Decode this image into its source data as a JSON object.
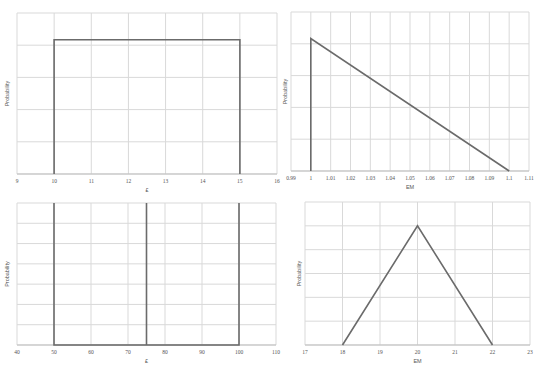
{
  "chart_data": [
    {
      "id": "top-left",
      "type": "line",
      "title": "",
      "xlabel": "£",
      "ylabel": "Probability",
      "xlim": [
        9,
        16
      ],
      "x_ticks": [
        "9",
        "10",
        "11",
        "12",
        "13",
        "14",
        "15",
        "16"
      ],
      "ylim": [
        0,
        1.2
      ],
      "y_gridlines": 5,
      "grid": true,
      "legend": "none",
      "series": [
        {
          "name": "Uniform",
          "x": [
            10,
            10,
            15,
            15
          ],
          "y": [
            0,
            1,
            1,
            0
          ]
        }
      ]
    },
    {
      "id": "top-right",
      "type": "line",
      "title": "",
      "xlabel": "EM",
      "ylabel": "Probability",
      "xlim": [
        0.99,
        1.11
      ],
      "x_ticks": [
        "0.99",
        "1",
        "1.01",
        "1.02",
        "1.03",
        "1.04",
        "1.05",
        "1.06",
        "1.07",
        "1.08",
        "1.09",
        "1.1",
        "1.11"
      ],
      "ylim": [
        0,
        1.2
      ],
      "y_gridlines": 5,
      "grid": true,
      "legend": "none",
      "series": [
        {
          "name": "Right-triangular",
          "x": [
            1,
            1,
            1.1
          ],
          "y": [
            0,
            1,
            0
          ]
        }
      ]
    },
    {
      "id": "bottom-left",
      "type": "line",
      "title": "",
      "xlabel": "£",
      "ylabel": "Probability",
      "xlim": [
        40,
        110
      ],
      "x_ticks": [
        "40",
        "50",
        "60",
        "70",
        "80",
        "90",
        "100",
        "110"
      ],
      "ylim": [
        0,
        1
      ],
      "y_gridlines": 7,
      "grid": true,
      "legend": "none",
      "series": [
        {
          "name": "Discrete",
          "x": [
            50,
            50,
            50,
            75,
            75,
            75,
            100,
            100
          ],
          "y": [
            1,
            0,
            0,
            0,
            1,
            0,
            0,
            1
          ]
        }
      ]
    },
    {
      "id": "bottom-right",
      "type": "line",
      "title": "",
      "xlabel": "EM",
      "ylabel": "Probability",
      "xlim": [
        17,
        23
      ],
      "x_ticks": [
        "17",
        "18",
        "19",
        "20",
        "21",
        "22",
        "23"
      ],
      "ylim": [
        0,
        1.2
      ],
      "y_gridlines": 6,
      "grid": true,
      "legend": "none",
      "series": [
        {
          "name": "Triangular",
          "x": [
            18,
            20,
            22
          ],
          "y": [
            0,
            1,
            0
          ]
        }
      ]
    }
  ],
  "charts": [
    {
      "box": {
        "left": 17,
        "top": 13,
        "width": 260,
        "height": 161
      },
      "ylabel_x": 9
    },
    {
      "box": {
        "left": 291,
        "top": 12,
        "width": 238,
        "height": 159
      },
      "ylabel_x": 287
    },
    {
      "box": {
        "left": 17,
        "top": 203,
        "width": 259,
        "height": 142
      },
      "ylabel_x": 9
    },
    {
      "box": {
        "left": 305,
        "top": 202,
        "width": 225,
        "height": 143
      },
      "ylabel_x": 301
    }
  ],
  "colors": {
    "series": "#6b6b6b",
    "grid": "#d9d9d9",
    "text": "#555555"
  }
}
